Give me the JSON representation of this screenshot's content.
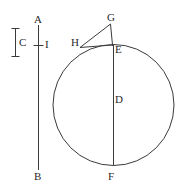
{
  "figure": {
    "type": "geometry-diagram",
    "canvas": {
      "width": 189,
      "height": 193,
      "background": "#ffffff"
    },
    "stroke_color": "#3a3a3a",
    "label_color": "#2a2a2a",
    "labels": [
      {
        "id": "A",
        "text": "A",
        "x": 34,
        "y": 14
      },
      {
        "id": "C",
        "text": "C",
        "x": 19,
        "y": 37
      },
      {
        "id": "I",
        "text": "I",
        "x": 45,
        "y": 39
      },
      {
        "id": "B",
        "text": "B",
        "x": 34,
        "y": 171
      },
      {
        "id": "G",
        "text": "G",
        "x": 107,
        "y": 12
      },
      {
        "id": "H",
        "text": "H",
        "x": 71,
        "y": 37
      },
      {
        "id": "E",
        "text": "E",
        "x": 115,
        "y": 44
      },
      {
        "id": "D",
        "text": "D",
        "x": 115,
        "y": 94
      },
      {
        "id": "F",
        "text": "F",
        "x": 108,
        "y": 171
      }
    ],
    "circle": {
      "cx": 113.5,
      "cy": 105,
      "r": 60.5
    },
    "diameter": {
      "from": "E",
      "to": "F",
      "x1": 113.5,
      "y1": 44.5,
      "x2": 113.5,
      "y2": 165.5
    },
    "point_g": {
      "x": 110.5,
      "y": 24
    },
    "point_h": {
      "x": 80.5,
      "y": 47
    },
    "segment_ge": {
      "x1": 110.5,
      "y1": 24,
      "x2": 112.5,
      "y2": 46
    },
    "segment_gh": {
      "x1": 110.5,
      "y1": 24,
      "x2": 80.5,
      "y2": 47
    },
    "segment_he": {
      "x1": 80.5,
      "y1": 47,
      "x2": 112.5,
      "y2": 45
    },
    "line_ab": {
      "x1": 38,
      "y1": 25,
      "x2": 38,
      "y2": 170
    },
    "tick_i": {
      "x1": 33,
      "y1": 45,
      "x2": 43,
      "y2": 45
    },
    "bracket_c": {
      "x": 15,
      "y_top": 28,
      "y_bottom": 57,
      "cap_half_width": 4
    }
  }
}
